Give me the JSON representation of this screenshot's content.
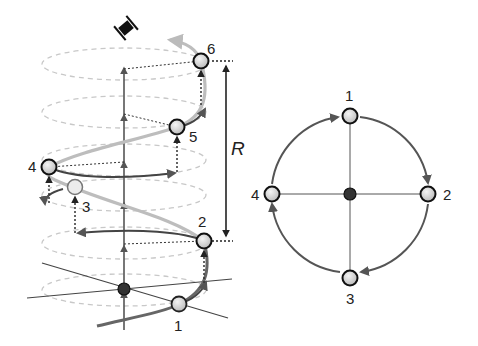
{
  "helix_diagram": {
    "points": [
      {
        "label": "1",
        "x": 179,
        "y": 304
      },
      {
        "label": "2",
        "x": 204,
        "y": 241
      },
      {
        "label": "3",
        "x": 75,
        "y": 187
      },
      {
        "label": "4",
        "x": 49,
        "y": 167
      },
      {
        "label": "5",
        "x": 177,
        "y": 127
      },
      {
        "label": "6",
        "x": 201,
        "y": 61
      }
    ],
    "label_positions": [
      {
        "label": "1",
        "x": 174,
        "y": 331
      },
      {
        "label": "2",
        "x": 198,
        "y": 227
      },
      {
        "label": "3",
        "x": 82,
        "y": 212
      },
      {
        "label": "4",
        "x": 28,
        "y": 172
      },
      {
        "label": "5",
        "x": 189,
        "y": 142
      },
      {
        "label": "6",
        "x": 207,
        "y": 54
      }
    ],
    "dimension_label": "R",
    "rotation_icon": "screw-icon",
    "colors": {
      "helix_light": "#bfbfbf",
      "helix_dark": "#555555",
      "ellipse_dashed": "#c8c8c8",
      "axis": "#555555",
      "center_node": "#333333",
      "node_fill": "#d8d8d8",
      "node_stroke": "#111111"
    }
  },
  "circle_diagram": {
    "center": {
      "x": 350,
      "y": 194
    },
    "radius": 78,
    "points": [
      {
        "label": "1",
        "position": "top"
      },
      {
        "label": "2",
        "position": "right"
      },
      {
        "label": "3",
        "position": "bottom"
      },
      {
        "label": "4",
        "position": "left"
      }
    ],
    "direction": "clockwise"
  }
}
